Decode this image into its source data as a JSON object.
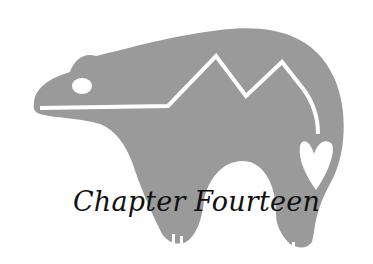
{
  "chapter": {
    "title": "Chapter Fourteen",
    "emblem": "bear-heartline-icon",
    "colors": {
      "bear": "#9a9a9a",
      "line": "#ffffff",
      "text": "#111111"
    }
  }
}
